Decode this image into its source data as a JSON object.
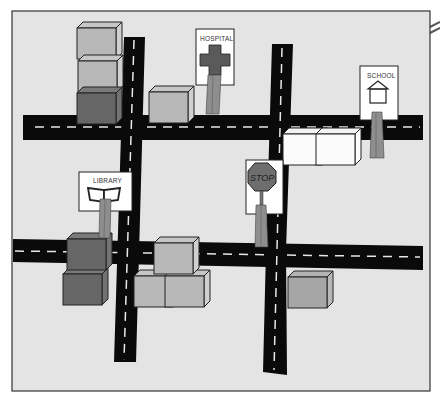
{
  "map": {
    "title": "Town map with streets, buildings and signs",
    "board_color": "#e4e4e4",
    "border_color": "#333333",
    "road_color": "#0a0a0a",
    "lane_marking_color": "#e8e8e8"
  },
  "roads": {
    "horizontal": [
      {
        "name": "upper-street",
        "y": 92,
        "height": 25
      },
      {
        "name": "lower-street",
        "y": 238,
        "height": 25
      }
    ],
    "vertical": [
      {
        "name": "left-avenue",
        "x": 122,
        "width": 20
      },
      {
        "name": "right-avenue",
        "x": 270,
        "width": 20
      }
    ]
  },
  "signs": {
    "hospital": {
      "label": "HOSPITAL",
      "icon": "red-cross-icon",
      "icon_color": "#5a5a5a"
    },
    "school": {
      "label": "SCHOOL",
      "icon": "house-icon"
    },
    "stop": {
      "label": "STOP",
      "icon": "octagon-stop-icon",
      "icon_color": "#6e6e6e"
    },
    "library": {
      "label": "LIBRARY",
      "icon": "open-book-icon"
    }
  },
  "blocks": {
    "colors": {
      "light": "#b8b8b8",
      "medium": "#a0a0a0",
      "dark": "#6a6a6a",
      "white": "#fafafa"
    },
    "count": 14
  }
}
